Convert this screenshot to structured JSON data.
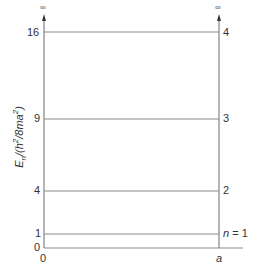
{
  "diagram": {
    "type": "particle-in-a-box energy levels",
    "y_axis_label": "E_n/(h²/8ma²)",
    "y_axis_label_parts": {
      "main": "E",
      "sub": "n",
      "rest": "/(h",
      "sup1": "2",
      "mid": "/8ma",
      "sup2": "2",
      "end": ")"
    },
    "x_axis_ticks": [
      "0",
      "a"
    ],
    "y_axis_ticks": [
      "0",
      "1",
      "4",
      "9",
      "16"
    ],
    "walls_height_symbol": "∞",
    "levels": [
      {
        "n_label": "n = 1",
        "value": 1
      },
      {
        "n_label": "2",
        "value": 4
      },
      {
        "n_label": "3",
        "value": 9
      },
      {
        "n_label": "4",
        "value": 16
      }
    ],
    "colors": {
      "line": "#888888",
      "text": "#333333"
    }
  }
}
